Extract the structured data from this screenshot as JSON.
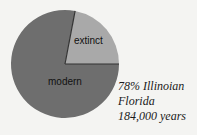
{
  "chart_data": {
    "type": "pie",
    "title": "",
    "slices": [
      {
        "label": "modern",
        "value": 78,
        "color": "#6e6e6e"
      },
      {
        "label": "extinct",
        "value": 22,
        "color": "#a9a9a9"
      }
    ],
    "annotation": [
      "78% Illinoian",
      "Florida",
      "184,000 years"
    ]
  },
  "caption": {
    "line1": "78% Illinoian",
    "line2": "Florida",
    "line3": "184,000 years"
  },
  "labels": {
    "extinct": "extinct",
    "modern": "modern"
  }
}
